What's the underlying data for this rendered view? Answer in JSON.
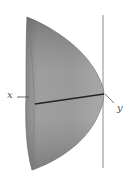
{
  "figure": {
    "type": "paraboloid-solid-of-revolution",
    "labels": {
      "x_axis": "x",
      "y_axis": "y"
    },
    "colors": {
      "surface_light": "#a9a9a9",
      "surface_mid": "#959595",
      "surface_dark": "#6e6e6e",
      "axis_line": "#222222",
      "vertical_line": "#888888",
      "background": "#ffffff"
    }
  }
}
